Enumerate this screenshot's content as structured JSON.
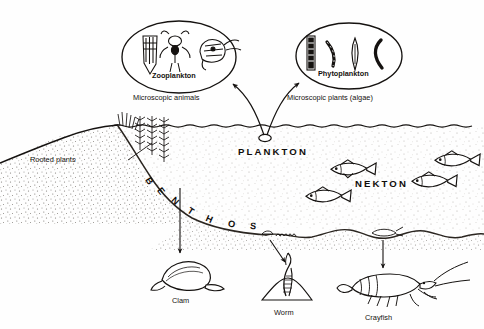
{
  "diagram": {
    "ink_color": "#151210",
    "paper_color": "#fefefe"
  },
  "ovals": [
    {
      "id": "zooplankton",
      "caption": "Zooplankton",
      "subcaption": "Microscopic animals",
      "organisms": [
        "diatom-cluster-icon",
        "copepod-icon",
        "rotifer-icon"
      ]
    },
    {
      "id": "phytoplankton",
      "caption": "Phytoplankton",
      "subcaption": "Microscopic plants (algae)",
      "organisms": [
        "diatom-chain-icon",
        "filament-icon",
        "spindle-algae-icon",
        "crescent-algae-icon"
      ]
    }
  ],
  "zones": {
    "plankton": "PLANKTON",
    "nekton": "NEKTON",
    "benthos": "BENTHOS"
  },
  "labels": {
    "rooted_plants": "Rooted plants",
    "clam": "Clam",
    "worm": "Worm",
    "crayfish": "Crayfish"
  },
  "organisms": {
    "fish": [
      "fish-icon",
      "fish-icon",
      "fish-icon",
      "fish-icon"
    ],
    "clam": "clam-icon",
    "worm": "worm-icon",
    "crayfish": "crayfish-icon"
  }
}
